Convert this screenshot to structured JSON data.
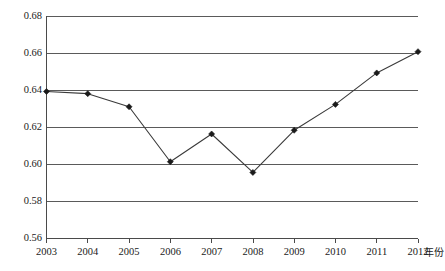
{
  "chart_data": {
    "type": "line",
    "title": "",
    "subtitle": "",
    "xlabel": "年份",
    "ylabel": "",
    "categories": [
      "2003",
      "2004",
      "2005",
      "2006",
      "2007",
      "2008",
      "2009",
      "2010",
      "2011",
      "2012"
    ],
    "values": [
      0.6395,
      0.6383,
      0.6312,
      0.6015,
      0.6165,
      0.5957,
      0.6185,
      0.6325,
      0.6495,
      0.661
    ],
    "series": [
      {
        "name": "",
        "values": [
          0.6395,
          0.6383,
          0.6312,
          0.6015,
          0.6165,
          0.5957,
          0.6185,
          0.6325,
          0.6495,
          0.661
        ]
      }
    ],
    "ylim": [
      0.56,
      0.68
    ],
    "xlim": [
      "2003",
      "2012"
    ],
    "ytick_labels": [
      "0.68",
      "0.66",
      "0.64",
      "0.62",
      "0.60",
      "0.58",
      "0.56"
    ],
    "ytick_values": [
      0.68,
      0.66,
      0.64,
      0.62,
      0.6,
      0.58,
      0.56
    ],
    "xtick_labels": [
      "2003",
      "2004",
      "2005",
      "2006",
      "2007",
      "2008",
      "2009",
      "2010",
      "2011",
      "2012"
    ],
    "grid": true,
    "grid_axis": "y",
    "legend": false,
    "legend_position": "none",
    "marker": "diamond",
    "line_color": "#3a3a3a",
    "marker_color": "#1a1a1a",
    "grid_color": "#5a5a5a",
    "axis_color": "#4a4a4a",
    "background_color": "#ffffff",
    "annotations": []
  },
  "axis": {
    "x_title": "年份"
  },
  "ylabels": {
    "t0": "0.68",
    "t1": "0.66",
    "t2": "0.64",
    "t3": "0.62",
    "t4": "0.60",
    "t5": "0.58",
    "t6": "0.56"
  },
  "xlabels": {
    "t0": "2003",
    "t1": "2004",
    "t2": "2005",
    "t3": "2006",
    "t4": "2007",
    "t5": "2008",
    "t6": "2009",
    "t7": "2010",
    "t8": "2011",
    "t9": "2012"
  }
}
